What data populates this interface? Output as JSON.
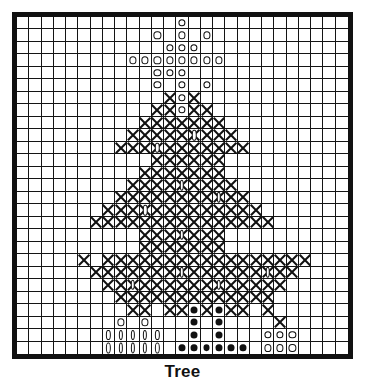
{
  "caption": "Tree",
  "chart_data": {
    "type": "heatmap",
    "title": "Tree",
    "xlabel": "",
    "ylabel": "",
    "grid": true,
    "legend_position": "none",
    "columns": 27,
    "rows": 27,
    "symbol_legend": {
      "blank": "empty stitch",
      "o": "open circle",
      "x": "cross stitch",
      "d": "filled dot",
      "v": "vertical oval",
      "xv": "cross with vertical oval",
      "xo": "cross with open circle"
    },
    "colors": {
      "ink": "#111111",
      "background": "#ffffff",
      "border": "#111111"
    },
    "cells": [
      [
        "",
        "",
        "",
        "",
        "",
        "",
        "",
        "",
        "",
        "",
        "",
        "",
        "",
        "o",
        "",
        "",
        "",
        "",
        "",
        "",
        "",
        "",
        "",
        "",
        "",
        "",
        ""
      ],
      [
        "",
        "",
        "",
        "",
        "",
        "",
        "",
        "",
        "",
        "",
        "",
        "o",
        "",
        "o",
        "",
        "o",
        "",
        "",
        "",
        "",
        "",
        "",
        "",
        "",
        "",
        "",
        ""
      ],
      [
        "",
        "",
        "",
        "",
        "",
        "",
        "",
        "",
        "",
        "",
        "",
        "",
        "o",
        "o",
        "o",
        "",
        "",
        "",
        "",
        "",
        "",
        "",
        "",
        "",
        "",
        "",
        ""
      ],
      [
        "",
        "",
        "",
        "",
        "",
        "",
        "",
        "",
        "",
        "o",
        "o",
        "o",
        "o",
        "o",
        "o",
        "o",
        "o",
        "",
        "",
        "",
        "",
        "",
        "",
        "",
        "",
        "",
        ""
      ],
      [
        "",
        "",
        "",
        "",
        "",
        "",
        "",
        "",
        "",
        "",
        "",
        "o",
        "o",
        "o",
        "",
        "",
        "",
        "",
        "",
        "",
        "",
        "",
        "",
        "",
        "",
        "",
        ""
      ],
      [
        "",
        "",
        "",
        "",
        "",
        "",
        "",
        "",
        "",
        "",
        "",
        "o",
        "",
        "o",
        "",
        "o",
        "",
        "",
        "",
        "",
        "",
        "",
        "",
        "",
        "",
        "",
        ""
      ],
      [
        "",
        "",
        "",
        "",
        "",
        "",
        "",
        "",
        "",
        "",
        "",
        "",
        "x",
        "o",
        "x",
        "",
        "",
        "",
        "",
        "",
        "",
        "",
        "",
        "",
        "",
        "",
        ""
      ],
      [
        "",
        "",
        "",
        "",
        "",
        "",
        "",
        "",
        "",
        "",
        "",
        "x",
        "x",
        "o",
        "x",
        "x",
        "",
        "",
        "",
        "",
        "",
        "",
        "",
        "",
        "",
        "",
        ""
      ],
      [
        "",
        "",
        "",
        "",
        "",
        "",
        "",
        "",
        "",
        "",
        "x",
        "x",
        "x",
        "x",
        "x",
        "x",
        "x",
        "",
        "",
        "",
        "",
        "",
        "",
        "",
        "",
        "",
        ""
      ],
      [
        "",
        "",
        "",
        "",
        "",
        "",
        "",
        "",
        "",
        "x",
        "x",
        "x",
        "x",
        "x",
        "xv",
        "x",
        "x",
        "x",
        "",
        "",
        "",
        "",
        "",
        "",
        "",
        "",
        ""
      ],
      [
        "",
        "",
        "",
        "",
        "",
        "",
        "",
        "",
        "x",
        "x",
        "x",
        "xv",
        "x",
        "x",
        "x",
        "x",
        "x",
        "x",
        "x",
        "",
        "",
        "",
        "",
        "",
        "",
        "",
        ""
      ],
      [
        "",
        "",
        "",
        "",
        "",
        "",
        "",
        "",
        "",
        "",
        "",
        "x",
        "x",
        "x",
        "x",
        "x",
        "x",
        "",
        "",
        "",
        "",
        "",
        "",
        "",
        "",
        "",
        ""
      ],
      [
        "",
        "",
        "",
        "",
        "",
        "",
        "",
        "",
        "",
        "",
        "x",
        "x",
        "x",
        "x",
        "x",
        "x",
        "x",
        "",
        "",
        "",
        "",
        "",
        "",
        "",
        "",
        "",
        ""
      ],
      [
        "",
        "",
        "",
        "",
        "",
        "",
        "",
        "",
        "",
        "x",
        "x",
        "x",
        "x",
        "xv",
        "x",
        "x",
        "x",
        "x",
        "",
        "",
        "",
        "",
        "",
        "",
        "",
        "",
        ""
      ],
      [
        "",
        "",
        "",
        "",
        "",
        "",
        "",
        "",
        "x",
        "x",
        "x",
        "x",
        "x",
        "x",
        "x",
        "x",
        "xv",
        "x",
        "x",
        "",
        "",
        "",
        "",
        "",
        "",
        "",
        ""
      ],
      [
        "",
        "",
        "",
        "",
        "",
        "",
        "",
        "x",
        "x",
        "x",
        "xv",
        "x",
        "x",
        "x",
        "x",
        "x",
        "x",
        "x",
        "x",
        "x",
        "",
        "",
        "",
        "",
        "",
        "",
        ""
      ],
      [
        "",
        "",
        "",
        "",
        "",
        "",
        "x",
        "x",
        "x",
        "x",
        "x",
        "x",
        "x",
        "x",
        "x",
        "x",
        "x",
        "x",
        "x",
        "x",
        "x",
        "",
        "",
        "",
        "",
        "",
        ""
      ],
      [
        "",
        "",
        "",
        "",
        "",
        "",
        "",
        "",
        "",
        "",
        "x",
        "x",
        "x",
        "xv",
        "x",
        "x",
        "x",
        "",
        "",
        "",
        "",
        "",
        "",
        "",
        "",
        "",
        ""
      ],
      [
        "",
        "",
        "",
        "",
        "",
        "",
        "",
        "",
        "",
        "",
        "x",
        "x",
        "x",
        "x",
        "x",
        "x",
        "x",
        "",
        "",
        "",
        "",
        "",
        "",
        "",
        "",
        "",
        ""
      ],
      [
        "",
        "",
        "",
        "",
        "",
        "x",
        "",
        "x",
        "x",
        "x",
        "x",
        "x",
        "x",
        "x",
        "x",
        "x",
        "x",
        "x",
        "x",
        "x",
        "x",
        "x",
        "x",
        "x",
        "",
        "",
        ""
      ],
      [
        "",
        "",
        "",
        "",
        "",
        "",
        "x",
        "x",
        "x",
        "x",
        "x",
        "x",
        "x",
        "xv",
        "x",
        "x",
        "x",
        "x",
        "x",
        "x",
        "xv",
        "x",
        "x",
        "",
        "",
        "",
        ""
      ],
      [
        "",
        "",
        "",
        "",
        "",
        "",
        "",
        "x",
        "x",
        "xv",
        "x",
        "x",
        "x",
        "x",
        "x",
        "x",
        "xv",
        "x",
        "x",
        "x",
        "x",
        "x",
        "",
        "",
        "",
        "",
        ""
      ],
      [
        "",
        "",
        "",
        "",
        "",
        "",
        "",
        "",
        "x",
        "x",
        "x",
        "x",
        "x",
        "x",
        "x",
        "x",
        "x",
        "x",
        "x",
        "x",
        "x",
        "",
        "",
        "",
        "",
        "",
        ""
      ],
      [
        "",
        "",
        "",
        "",
        "",
        "",
        "",
        "",
        "",
        "x",
        "x",
        "",
        "x",
        "x",
        "d",
        "x",
        "d",
        "x",
        "x",
        "",
        "x",
        "",
        "",
        "",
        "",
        "",
        ""
      ],
      [
        "",
        "",
        "",
        "",
        "",
        "",
        "",
        "",
        "o",
        "",
        "o",
        "",
        "",
        "",
        "d",
        "",
        "d",
        "",
        "",
        "",
        "",
        "x",
        "",
        "",
        "",
        "",
        ""
      ],
      [
        "",
        "",
        "",
        "",
        "",
        "",
        "",
        "v",
        "v",
        "v",
        "v",
        "v",
        "",
        "",
        "d",
        "",
        "d",
        "",
        "",
        "",
        "o",
        "o",
        "o",
        "",
        "",
        "",
        ""
      ],
      [
        "",
        "",
        "",
        "",
        "",
        "",
        "",
        "v",
        "v",
        "v",
        "v",
        "v",
        "",
        "d",
        "d",
        "d",
        "d",
        "d",
        "d",
        "",
        "o",
        "o",
        "o",
        "",
        "",
        "",
        ""
      ]
    ]
  }
}
